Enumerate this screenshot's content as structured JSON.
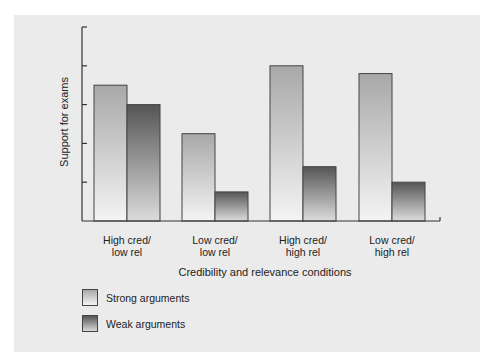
{
  "chart_data": {
    "type": "bar",
    "title": "",
    "xlabel": "Credibility and relevance conditions",
    "ylabel": "Support for exams",
    "categories": [
      "High cred/\nlow rel",
      "Low cred/\nlow rel",
      "High cred/\nhigh rel",
      "Low cred/\nhigh rel"
    ],
    "category_lines": [
      [
        "High cred/",
        "low rel"
      ],
      [
        "Low cred/",
        "low rel"
      ],
      [
        "High cred/",
        "high rel"
      ],
      [
        "Low cred/",
        "high rel"
      ]
    ],
    "series": [
      {
        "name": "Strong arguments",
        "values": [
          3.5,
          2.25,
          4.0,
          3.8
        ]
      },
      {
        "name": "Weak arguments",
        "values": [
          3.0,
          0.75,
          1.4,
          1.0
        ]
      }
    ],
    "ylim": [
      0,
      5
    ],
    "yticks_count": 5,
    "ytick_labels": [],
    "grid": false,
    "legend_position": "bottom-left"
  },
  "legend": [
    {
      "label": "Strong arguments",
      "style": "strong"
    },
    {
      "label": "Weak arguments",
      "style": "weak"
    }
  ],
  "colors": {
    "panel_bg": "#ebebeb",
    "axis": "#333333",
    "strong_top": "#a8a8a8",
    "strong_bottom": "#f4f4f4",
    "weak_top": "#555555",
    "weak_bottom": "#d8d8d8"
  }
}
